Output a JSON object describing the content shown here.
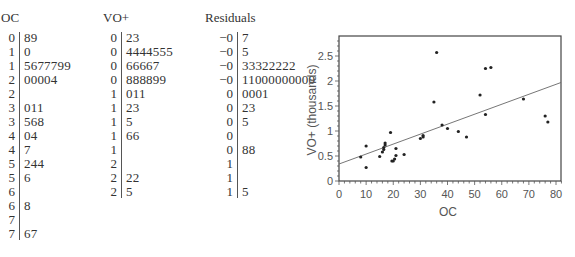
{
  "stem_leaf_plots": {
    "oc": {
      "title": "OC",
      "rows": [
        {
          "stem": "0",
          "leaves": "89"
        },
        {
          "stem": "1",
          "leaves": "0"
        },
        {
          "stem": "1",
          "leaves": "5677799"
        },
        {
          "stem": "2",
          "leaves": "00004"
        },
        {
          "stem": "2",
          "leaves": ""
        },
        {
          "stem": "3",
          "leaves": "011"
        },
        {
          "stem": "3",
          "leaves": "568"
        },
        {
          "stem": "4",
          "leaves": "04"
        },
        {
          "stem": "4",
          "leaves": "7"
        },
        {
          "stem": "5",
          "leaves": "244"
        },
        {
          "stem": "5",
          "leaves": "6"
        },
        {
          "stem": "6",
          "leaves": ""
        },
        {
          "stem": "6",
          "leaves": "8"
        },
        {
          "stem": "7",
          "leaves": ""
        },
        {
          "stem": "7",
          "leaves": "67"
        }
      ]
    },
    "vo": {
      "title": "VO+",
      "rows": [
        {
          "stem": "0",
          "leaves": "23"
        },
        {
          "stem": "0",
          "leaves": "4444555"
        },
        {
          "stem": "0",
          "leaves": "66667"
        },
        {
          "stem": "0",
          "leaves": "888899"
        },
        {
          "stem": "1",
          "leaves": "011"
        },
        {
          "stem": "1",
          "leaves": "23"
        },
        {
          "stem": "1",
          "leaves": "5"
        },
        {
          "stem": "1",
          "leaves": "66"
        },
        {
          "stem": "1",
          "leaves": ""
        },
        {
          "stem": "2",
          "leaves": ""
        },
        {
          "stem": "2",
          "leaves": "22"
        },
        {
          "stem": "2",
          "leaves": "5"
        }
      ]
    },
    "residuals": {
      "title": "Residuals",
      "rows": [
        {
          "stem": "−0",
          "leaves": "7"
        },
        {
          "stem": "−0",
          "leaves": "5"
        },
        {
          "stem": "−0",
          "leaves": "33322222"
        },
        {
          "stem": "−0",
          "leaves": "11000000000"
        },
        {
          "stem": "0",
          "leaves": "0001"
        },
        {
          "stem": "0",
          "leaves": "23"
        },
        {
          "stem": "0",
          "leaves": "5"
        },
        {
          "stem": "0",
          "leaves": ""
        },
        {
          "stem": "0",
          "leaves": "88"
        },
        {
          "stem": "1",
          "leaves": ""
        },
        {
          "stem": "1",
          "leaves": ""
        },
        {
          "stem": "1",
          "leaves": "5"
        }
      ]
    }
  },
  "chart_data": {
    "type": "scatter",
    "title": "",
    "xlabel": "OC",
    "ylabel": "VO+ (thousands)",
    "xlim": [
      0,
      82
    ],
    "ylim": [
      0,
      2.9
    ],
    "xticks": [
      0,
      10,
      20,
      30,
      40,
      50,
      60,
      70,
      80
    ],
    "yticks": [
      0,
      0.5,
      1,
      1.5,
      2,
      2.5
    ],
    "ytick_labels": [
      "0",
      "0.5",
      "1",
      "1.5",
      "2",
      "2.5"
    ],
    "grid": false,
    "legend": null,
    "points": [
      {
        "x": 8,
        "y": 0.48
      },
      {
        "x": 10,
        "y": 0.27
      },
      {
        "x": 10,
        "y": 0.7
      },
      {
        "x": 15,
        "y": 0.49
      },
      {
        "x": 16,
        "y": 0.58
      },
      {
        "x": 16.5,
        "y": 0.63
      },
      {
        "x": 16.5,
        "y": 0.67
      },
      {
        "x": 17,
        "y": 0.72
      },
      {
        "x": 17,
        "y": 0.76
      },
      {
        "x": 19,
        "y": 0.97
      },
      {
        "x": 19.5,
        "y": 0.4
      },
      {
        "x": 20,
        "y": 0.4
      },
      {
        "x": 20.5,
        "y": 0.44
      },
      {
        "x": 21,
        "y": 0.51
      },
      {
        "x": 21,
        "y": 0.65
      },
      {
        "x": 24,
        "y": 0.53
      },
      {
        "x": 30,
        "y": 0.85
      },
      {
        "x": 31,
        "y": 0.88
      },
      {
        "x": 31,
        "y": 0.91
      },
      {
        "x": 35,
        "y": 1.58
      },
      {
        "x": 36,
        "y": 2.57
      },
      {
        "x": 38,
        "y": 1.12
      },
      {
        "x": 40,
        "y": 1.05
      },
      {
        "x": 44,
        "y": 0.99
      },
      {
        "x": 47,
        "y": 0.88
      },
      {
        "x": 52,
        "y": 1.72
      },
      {
        "x": 54,
        "y": 2.25
      },
      {
        "x": 54,
        "y": 1.33
      },
      {
        "x": 56,
        "y": 2.27
      },
      {
        "x": 68,
        "y": 1.64
      },
      {
        "x": 76,
        "y": 1.3
      },
      {
        "x": 77,
        "y": 1.18
      }
    ],
    "regression_line": {
      "x": [
        0,
        82
      ],
      "y": [
        0.34,
        1.97
      ]
    }
  }
}
